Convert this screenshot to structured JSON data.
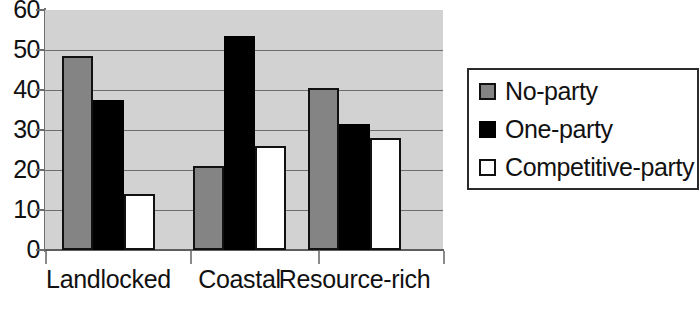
{
  "chart_data": {
    "type": "bar",
    "title": "",
    "subtitle": "",
    "xlabel": "",
    "ylabel": "",
    "categories": [
      "Landlocked",
      "Coastal",
      "Resource-rich"
    ],
    "series": [
      {
        "name": "No-party",
        "color": "#848484",
        "values": [
          48.5,
          21.0,
          40.5
        ]
      },
      {
        "name": "One-party",
        "color": "#000000",
        "values": [
          37.5,
          53.5,
          31.5
        ]
      },
      {
        "name": "Competitive-party",
        "color": "#ffffff",
        "values": [
          14.0,
          26.0,
          28.0
        ]
      }
    ],
    "ylim": [
      0,
      60
    ],
    "ytick_values": [
      0,
      10,
      20,
      30,
      40,
      50,
      60
    ],
    "ytick_labels": [
      "0",
      "10",
      "20",
      "30",
      "40",
      "50",
      "60"
    ],
    "grid": true,
    "grid_axis": "y",
    "legend_position": "right",
    "plot_background": "#d2d2d2",
    "bar_border_color": "#111111",
    "annotations": []
  }
}
